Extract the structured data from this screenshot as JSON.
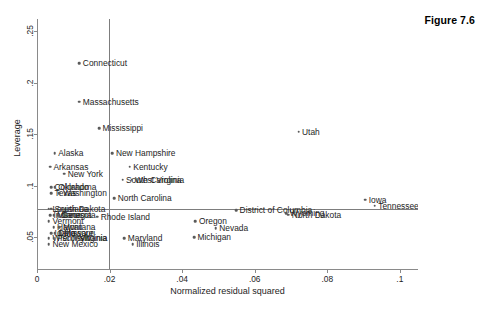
{
  "figure": {
    "caption": "Figure 7.6"
  },
  "chart_data": {
    "type": "scatter",
    "title": "",
    "xlabel": "Normalized residual squared",
    "ylabel": "Leverage",
    "xlim": [
      0,
      0.105
    ],
    "ylim": [
      0.018,
      0.262
    ],
    "xticks": [
      "0",
      ".02",
      ".04",
      ".06",
      ".08",
      ".1"
    ],
    "xtick_values": [
      0,
      0.02,
      0.04,
      0.06,
      0.08,
      0.1
    ],
    "yticks": [
      ".05",
      ".1",
      ".15",
      ".2",
      ".25"
    ],
    "ytick_values": [
      0.05,
      0.1,
      0.15,
      0.2,
      0.25
    ],
    "grid": false,
    "legend": "none",
    "reference_lines": {
      "vertical_x": 0.0197,
      "horizontal_y": 0.0775
    },
    "point_color": "#5a5a5a",
    "points": [
      {
        "label": "Connecticut",
        "x": 0.0114,
        "y": 0.219,
        "side": "right"
      },
      {
        "label": "Massachusetts",
        "x": 0.0114,
        "y": 0.1815,
        "side": "right"
      },
      {
        "label": "Mississippi",
        "x": 0.0168,
        "y": 0.1558,
        "side": "right"
      },
      {
        "label": "Utah",
        "x": 0.0718,
        "y": 0.1525,
        "side": "right"
      },
      {
        "label": "Alaska",
        "x": 0.0046,
        "y": 0.1318,
        "side": "right"
      },
      {
        "label": "New Hampshire",
        "x": 0.0205,
        "y": 0.1318,
        "side": "right"
      },
      {
        "label": "Arkansas",
        "x": 0.0033,
        "y": 0.1185,
        "side": "right"
      },
      {
        "label": "Kentucky",
        "x": 0.0253,
        "y": 0.1185,
        "side": "right"
      },
      {
        "label": "New York",
        "x": 0.0072,
        "y": 0.1115,
        "side": "right"
      },
      {
        "label": "South Carolina",
        "x": 0.0233,
        "y": 0.1058,
        "side": "right"
      },
      {
        "label": "West Virginia",
        "x": 0.0258,
        "y": 0.1058,
        "side": "right"
      },
      {
        "label": "Colorado",
        "x": 0.0036,
        "y": 0.0985,
        "side": "right"
      },
      {
        "label": "Oklahoma",
        "x": 0.0046,
        "y": 0.0985,
        "side": "right"
      },
      {
        "label": "Texas",
        "x": 0.0036,
        "y": 0.0925,
        "side": "right"
      },
      {
        "label": "Washington",
        "x": 0.0059,
        "y": 0.0925,
        "side": "right"
      },
      {
        "label": "North Carolina",
        "x": 0.021,
        "y": 0.0878,
        "side": "right"
      },
      {
        "label": "Iowa",
        "x": 0.0902,
        "y": 0.0862,
        "side": "right"
      },
      {
        "label": "Tennessee",
        "x": 0.0928,
        "y": 0.0805,
        "side": "right"
      },
      {
        "label": "South Dakota",
        "x": 0.0036,
        "y": 0.0775,
        "side": "right"
      },
      {
        "label": "Louisiana",
        "x": 0.003,
        "y": 0.0775,
        "side": "right"
      },
      {
        "label": "District of Columbia",
        "x": 0.0546,
        "y": 0.076,
        "side": "right"
      },
      {
        "label": "Wyoming",
        "x": 0.0684,
        "y": 0.0735,
        "side": "right"
      },
      {
        "label": "North Dakota",
        "x": 0.069,
        "y": 0.0718,
        "side": "right"
      },
      {
        "label": "Indiana",
        "x": 0.0033,
        "y": 0.0712,
        "side": "right"
      },
      {
        "label": "Minnesota",
        "x": 0.0043,
        "y": 0.0712,
        "side": "right"
      },
      {
        "label": "Georgia",
        "x": 0.0056,
        "y": 0.0712,
        "side": "right"
      },
      {
        "label": "Rhode Island",
        "x": 0.0163,
        "y": 0.07,
        "side": "right"
      },
      {
        "label": "Vermont",
        "x": 0.003,
        "y": 0.0655,
        "side": "right"
      },
      {
        "label": "Oregon",
        "x": 0.0434,
        "y": 0.0655,
        "side": "right"
      },
      {
        "label": "Hawaii",
        "x": 0.0043,
        "y": 0.0598,
        "side": "right"
      },
      {
        "label": "Montana",
        "x": 0.0059,
        "y": 0.0598,
        "side": "right"
      },
      {
        "label": "Nevada",
        "x": 0.049,
        "y": 0.0588,
        "side": "right"
      },
      {
        "label": "Idaho",
        "x": 0.0036,
        "y": 0.054,
        "side": "right"
      },
      {
        "label": "Delaware",
        "x": 0.0046,
        "y": 0.054,
        "side": "right"
      },
      {
        "label": "Missouri",
        "x": 0.0062,
        "y": 0.054,
        "side": "right"
      },
      {
        "label": "Wisconsin",
        "x": 0.003,
        "y": 0.0488,
        "side": "right"
      },
      {
        "label": "Pennsylvania",
        "x": 0.0043,
        "y": 0.0488,
        "side": "right"
      },
      {
        "label": "Virginia",
        "x": 0.0105,
        "y": 0.0488,
        "side": "right"
      },
      {
        "label": "Maryland",
        "x": 0.0238,
        "y": 0.0488,
        "side": "right"
      },
      {
        "label": "Michigan",
        "x": 0.043,
        "y": 0.05,
        "side": "right"
      },
      {
        "label": "New Mexico",
        "x": 0.003,
        "y": 0.0428,
        "side": "right"
      },
      {
        "label": "Illinois",
        "x": 0.0261,
        "y": 0.0428,
        "side": "right"
      }
    ]
  }
}
